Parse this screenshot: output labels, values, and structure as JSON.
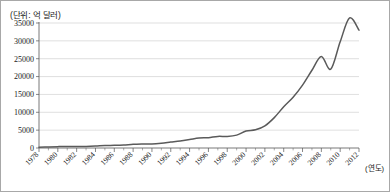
{
  "unit_note": "(단위: 억 달러)",
  "axis": {
    "x_axis_caption": "(연도)",
    "y_tick_labels": [
      "0",
      "5000",
      "10000",
      "15000",
      "20000",
      "25000",
      "30000",
      "35000"
    ],
    "x_tick_labels": [
      "1978",
      "1980",
      "1982",
      "1984",
      "1986",
      "1988",
      "1990",
      "1992",
      "1994",
      "1996",
      "1998",
      "2000",
      "2002",
      "2004",
      "2006",
      "2008",
      "2010",
      "2012"
    ]
  },
  "colors": {
    "line": "#5a5a5a",
    "grid": "#c9c9c9",
    "axis": "#555555",
    "frame": "#a8a8a8",
    "text": "#1a1a1a"
  },
  "chart_data": {
    "type": "line",
    "title": "",
    "subtitle": "",
    "xlabel": "(연도)",
    "ylabel": "",
    "unit": "억 달러",
    "grid": true,
    "legend": "none",
    "xlim": [
      1978,
      2012
    ],
    "ylim": [
      0,
      35000
    ],
    "ytick_interval": 5000,
    "xtick_interval": 2,
    "x": [
      1978,
      1979,
      1980,
      1981,
      1982,
      1983,
      1984,
      1985,
      1986,
      1987,
      1988,
      1989,
      1990,
      1991,
      1992,
      1993,
      1994,
      1995,
      1996,
      1997,
      1998,
      1999,
      2000,
      2001,
      2002,
      2003,
      2004,
      2005,
      2006,
      2007,
      2008,
      2009,
      2010,
      2011,
      2012
    ],
    "series": [
      {
        "name": "교역액",
        "values": [
          206,
          293,
          381,
          440,
          416,
          436,
          535,
          696,
          738,
          827,
          1028,
          1117,
          1154,
          1357,
          1656,
          1957,
          2366,
          2808,
          2899,
          3252,
          3240,
          3607,
          4743,
          5097,
          6208,
          8510,
          11546,
          14221,
          17607,
          21766,
          25633,
          22075,
          29740,
          36419,
          33000
        ]
      }
    ],
    "annotations": [
      "(단위: 억 달러)"
    ]
  }
}
